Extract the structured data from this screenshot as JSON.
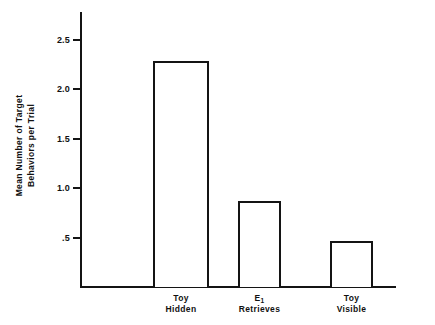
{
  "chart_data": {
    "type": "bar",
    "title": "",
    "subtitle": "",
    "xlabel": "",
    "ylabel_line1": "Mean Number of Target",
    "ylabel_line2": "Behaviors per Trial",
    "categories": [
      "Toy Hidden",
      "E1 Retrieves",
      "Toy Visible"
    ],
    "category_labels": [
      {
        "line1": "Toy",
        "line2": "Hidden",
        "subscript": ""
      },
      {
        "line1": "E",
        "line2": "Retrieves",
        "subscript": "1"
      },
      {
        "line1": "Toy",
        "line2": "Visible",
        "subscript": ""
      }
    ],
    "values": [
      2.28,
      0.87,
      0.46
    ],
    "ylim": [
      0,
      2.78
    ],
    "ytick_values": [
      2.5,
      2.0,
      1.5,
      1.0,
      0.5
    ],
    "ytick_labels": [
      "2.5",
      "2.0",
      "1.5",
      "1.0",
      ".5"
    ],
    "grid": false,
    "legend": "none",
    "bar_fill_color": "#ffffff",
    "bar_edge_color": "#141414",
    "axis_color": "#141414",
    "background_color": "#ffffff"
  }
}
